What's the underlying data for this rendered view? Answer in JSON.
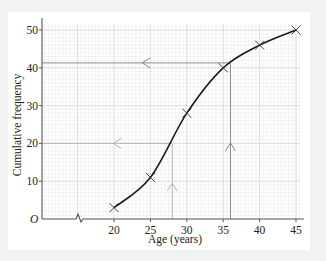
{
  "chart_data": {
    "type": "line",
    "title": "",
    "xlabel": "Age (years)",
    "ylabel": "Cumulative frequency",
    "origin_label": "O",
    "x": [
      20,
      25,
      30,
      35,
      40,
      45
    ],
    "series": [
      {
        "name": "Cumulative frequency",
        "values": [
          3,
          11,
          28,
          40,
          46,
          50
        ],
        "marker": "x",
        "smooth": true
      }
    ],
    "x_ticks": [
      "20",
      "25",
      "30",
      "35",
      "40",
      "45"
    ],
    "y_ticks": [
      "10",
      "20",
      "30",
      "40",
      "50"
    ],
    "xlim": [
      15,
      45
    ],
    "ylim": [
      0,
      52
    ],
    "x_axis_break": true,
    "grid": true,
    "annotations": [
      {
        "type": "reading-line",
        "description": "Horizontal at cumulative frequency 41.3 from curve to y-axis, then vertical down at age 36",
        "y": 41.3,
        "x": 36
      },
      {
        "type": "reading-line",
        "description": "Horizontal at cumulative frequency 20 from curve to y-axis, then vertical down at age 28",
        "y": 20,
        "x": 28
      }
    ]
  },
  "labels": {
    "xlabel": "Age (years)",
    "ylabel": "Cumulative frequency",
    "origin": "O",
    "x_ticks": [
      "20",
      "25",
      "30",
      "35",
      "40",
      "45"
    ],
    "y_ticks": [
      "10",
      "20",
      "30",
      "40",
      "50"
    ]
  },
  "colors": {
    "curve": "#1a1a1a",
    "axis": "#555555",
    "grid_minor": "#ececec",
    "grid_major": "#d4d4d4",
    "reading_line_dark": "#8a8a8a",
    "reading_line_light": "#b5b5b5"
  }
}
